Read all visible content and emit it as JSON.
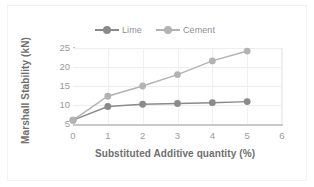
{
  "chart_data": {
    "type": "line",
    "title": "",
    "xlabel": "Substituted Additive quantity (%)",
    "ylabel": "Marshall Stability (kN)",
    "x": [
      0,
      1,
      2,
      3,
      4,
      5
    ],
    "xlim": [
      0,
      6
    ],
    "ylim": [
      5,
      25
    ],
    "xticks": [
      "0",
      "1",
      "2",
      "3",
      "4",
      "5",
      "6"
    ],
    "yticks": [
      "5",
      "10",
      "15",
      "20",
      "25"
    ],
    "grid": "horizontal-and-vertical",
    "legend_position": "top-center",
    "series": [
      {
        "name": "Lime",
        "color": "#8a8a8a",
        "values": [
          6.0,
          9.6,
          10.2,
          10.4,
          10.6,
          10.9
        ]
      },
      {
        "name": "Cement",
        "color": "#b3b3b3",
        "values": [
          6.0,
          12.3,
          15.0,
          18.0,
          21.6,
          24.2
        ]
      }
    ]
  },
  "legend": {
    "items": [
      {
        "label": "Lime",
        "color": "#8a8a8a"
      },
      {
        "label": "Cement",
        "color": "#b3b3b3"
      }
    ]
  },
  "colors": {
    "lime": "#8a8a8a",
    "cement": "#b3b3b3",
    "axis": "#c9c9c9",
    "grid": "#eeeeee",
    "tick_text": "#9a9a9a",
    "title_text": "#6f6f6f"
  }
}
